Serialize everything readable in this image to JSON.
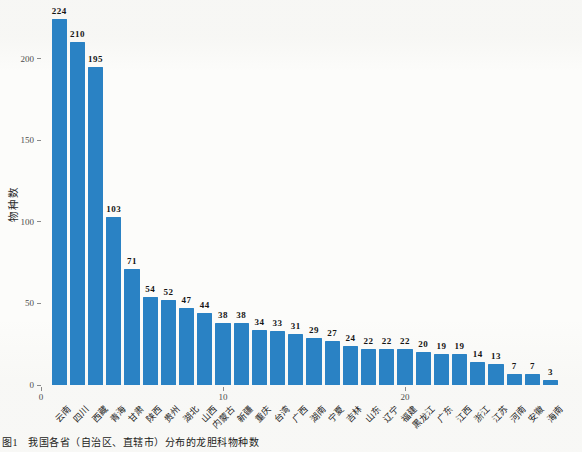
{
  "figure": {
    "caption_prefix": "图1",
    "caption_text": "我国各省（自治区、直辖市）分布的龙胆科物种数"
  },
  "chart_data": {
    "type": "bar",
    "title": "",
    "xlabel": "",
    "ylabel": "物种数",
    "categories": [
      "云南",
      "四川",
      "西藏",
      "青海",
      "甘肃",
      "陕西",
      "贵州",
      "湖北",
      "山西",
      "内蒙古",
      "新疆",
      "重庆",
      "台湾",
      "广西",
      "湖南",
      "宁夏",
      "吉林",
      "山东",
      "辽宁",
      "福建",
      "黑龙江",
      "广东",
      "江西",
      "浙江",
      "江苏",
      "河南",
      "安徽",
      "海南"
    ],
    "values": [
      224,
      210,
      195,
      103,
      71,
      54,
      52,
      47,
      44,
      38,
      38,
      34,
      33,
      31,
      29,
      27,
      24,
      22,
      22,
      22,
      20,
      19,
      19,
      14,
      13,
      7,
      7,
      3
    ],
    "yticks": [
      0,
      50,
      100,
      150,
      200
    ],
    "xticks": [
      0,
      10,
      20
    ],
    "ylim": [
      0,
      230
    ],
    "grid": false,
    "legend": "none",
    "value_labels": true,
    "bar_color": "#2a82c4",
    "axis_text_color": "#4d4d4d",
    "value_label_color": "#151515"
  }
}
